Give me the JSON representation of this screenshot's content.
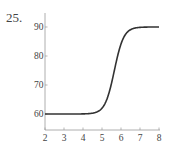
{
  "problem_number": "25.",
  "chart_data": {
    "type": "line",
    "title": "",
    "xlabel": "",
    "ylabel": "",
    "xlim": [
      2,
      8
    ],
    "ylim": [
      55,
      95
    ],
    "x_ticks": [
      2,
      3,
      4,
      5,
      6,
      7,
      8
    ],
    "y_ticks": [
      60,
      70,
      80,
      90
    ],
    "grid": false,
    "legend": null,
    "series": [
      {
        "name": "curve",
        "description": "logistic curve rising from 60 to 90, midpoint near x=5.65",
        "x": [
          2,
          3,
          4,
          4.5,
          5,
          5.25,
          5.5,
          5.65,
          5.75,
          6,
          6.25,
          6.5,
          7,
          7.5,
          8
        ],
        "y": [
          60.0,
          60.0,
          60.0,
          60.3,
          62.0,
          64.5,
          68.6,
          75.0,
          78.0,
          84.0,
          87.5,
          89.1,
          89.9,
          90.0,
          90.0
        ]
      }
    ],
    "colors": {
      "axis": "#9a9a9a",
      "curve": "#333333",
      "labels": "#444444"
    }
  }
}
